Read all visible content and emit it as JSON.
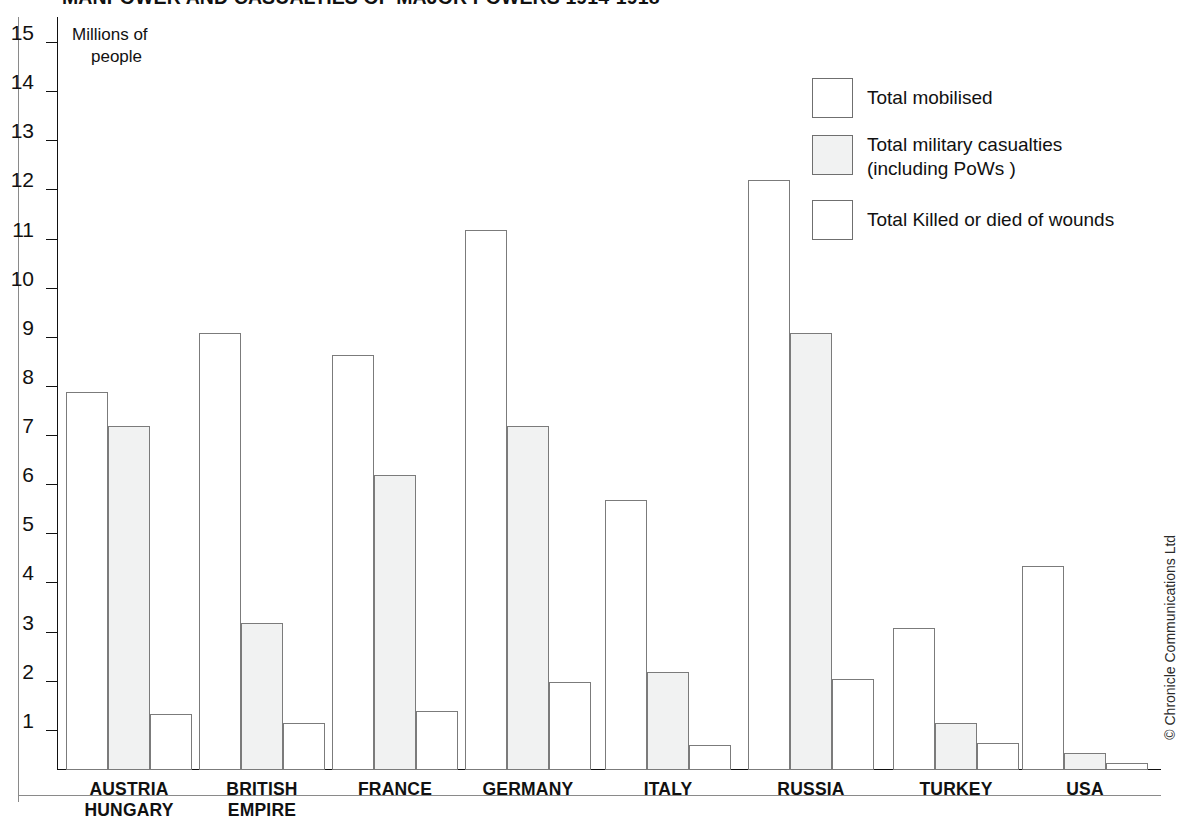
{
  "chart": {
    "title": "MANPOWER AND CASUALTIES OF MAJOR POWERS 1914-1918",
    "axis_caption_line1": "Millions of",
    "axis_caption_line2": "people",
    "copyright": "© Chronicle Communications Ltd"
  },
  "legend": {
    "items": [
      {
        "label": "Total mobilised",
        "label2": "",
        "swatch": "white"
      },
      {
        "label": "Total military casualties",
        "label2": "(including PoWs )",
        "swatch": "grey"
      },
      {
        "label": "Total Killed or died of wounds",
        "label2": "",
        "swatch": "white"
      }
    ]
  },
  "chart_data": {
    "type": "bar",
    "title": "MANPOWER AND CASUALTIES OF MAJOR POWERS 1914-1918",
    "xlabel": "",
    "ylabel": "Millions of people",
    "ylim": [
      0,
      15
    ],
    "yticks": [
      1,
      2,
      3,
      4,
      5,
      6,
      7,
      8,
      9,
      10,
      11,
      12,
      13,
      14,
      15
    ],
    "ytick_labels": [
      "1",
      "2",
      "3",
      "4",
      "5",
      "6",
      "7",
      "8",
      "9",
      "10",
      "11",
      "12",
      "13",
      "14",
      "15"
    ],
    "grid": false,
    "legend_position": "top-right",
    "categories": [
      "AUSTRIA HUNGARY",
      "BRITISH EMPIRE",
      "FRANCE",
      "GERMANY",
      "ITALY",
      "RUSSIA",
      "TURKEY",
      "USA"
    ],
    "category_lines": [
      [
        "AUSTRIA",
        "HUNGARY"
      ],
      [
        "BRITISH",
        "EMPIRE"
      ],
      [
        "FRANCE",
        ""
      ],
      [
        "GERMANY",
        ""
      ],
      [
        "ITALY",
        ""
      ],
      [
        "RUSSIA",
        ""
      ],
      [
        "TURKEY",
        ""
      ],
      [
        "USA",
        ""
      ]
    ],
    "series": [
      {
        "name": "Total mobilised",
        "values": [
          7.7,
          8.9,
          8.45,
          11.0,
          5.5,
          12.0,
          2.9,
          4.15
        ]
      },
      {
        "name": "Total military casualties (including PoWs )",
        "values": [
          7.0,
          3.0,
          6.0,
          7.0,
          2.0,
          8.9,
          0.95,
          0.35
        ]
      },
      {
        "name": "Total Killed or died of wounds",
        "values": [
          1.15,
          0.95,
          1.2,
          1.8,
          0.5,
          1.85,
          0.55,
          0.15
        ]
      }
    ]
  }
}
